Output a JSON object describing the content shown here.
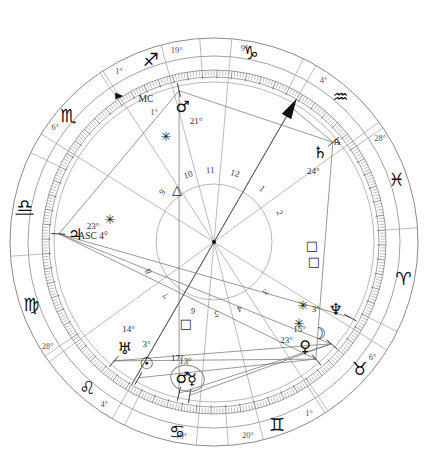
{
  "chart": {
    "type": "astrological-natal-wheel",
    "center": {
      "x": 214,
      "y": 242
    },
    "radii": {
      "outer_rim": 204,
      "sign_band_outer": 186,
      "degree_ring_outer": 172,
      "degree_ring_inner": 165,
      "house_circle": 160,
      "inner_circle": 58
    },
    "ascendant_offset_deg": 184
  },
  "signs": [
    {
      "name": "Aries",
      "glyph": "♈",
      "start_deg": 0
    },
    {
      "name": "Taurus",
      "glyph": "♉",
      "start_deg": 30
    },
    {
      "name": "Gemini",
      "glyph": "♊",
      "start_deg": 60
    },
    {
      "name": "Cancer",
      "glyph": "♋",
      "start_deg": 90
    },
    {
      "name": "Leo",
      "glyph": "♌",
      "start_deg": 120
    },
    {
      "name": "Virgo",
      "glyph": "♍",
      "start_deg": 150
    },
    {
      "name": "Libra",
      "glyph": "♎",
      "start_deg": 180,
      "underlined": true
    },
    {
      "name": "Scorpio",
      "glyph": "♏",
      "start_deg": 210
    },
    {
      "name": "Sagittarius",
      "glyph": "♐",
      "start_deg": 240
    },
    {
      "name": "Capricorn",
      "glyph": "♑",
      "start_deg": 270
    },
    {
      "name": "Aquarius",
      "glyph": "♒",
      "start_deg": 300
    },
    {
      "name": "Pisces",
      "glyph": "♓",
      "start_deg": 330
    }
  ],
  "house_cusps": [
    {
      "house": 1,
      "label": "4°",
      "abs_deg": 304,
      "sign": "Aquarius",
      "is_angle": true,
      "angle_name": "ASC"
    },
    {
      "house": 2,
      "label": "28°",
      "abs_deg": 328,
      "sign": "Pisces"
    },
    {
      "house": 3,
      "label": "6°",
      "abs_deg": 36,
      "sign": "Taurus"
    },
    {
      "house": 4,
      "label": "1°",
      "abs_deg": 61,
      "sign": "Gemini"
    },
    {
      "house": 5,
      "label": "20°",
      "abs_deg": 80,
      "sign": "Gemini"
    },
    {
      "house": 6,
      "label": "9°",
      "abs_deg": 99,
      "sign": "Cancer"
    },
    {
      "house": 7,
      "label": "4°",
      "abs_deg": 124,
      "sign": "Leo",
      "is_angle": true,
      "angle_name": "DSC"
    },
    {
      "house": 8,
      "label": "28°",
      "abs_deg": 148,
      "sign": "Leo"
    },
    {
      "house": 9,
      "label": "6°",
      "abs_deg": 216,
      "sign": "Scorpio"
    },
    {
      "house": 10,
      "label": "1°",
      "abs_deg": 241,
      "sign": "Sagittarius",
      "is_angle": true,
      "angle_name": "MC"
    },
    {
      "house": 11,
      "label": "19°",
      "abs_deg": 259,
      "sign": "Sagittarius"
    },
    {
      "house": 12,
      "label": "9°",
      "abs_deg": 279,
      "sign": "Capricorn"
    }
  ],
  "house_numbers": [
    {
      "n": "1",
      "abs_deg": 304
    },
    {
      "n": "2",
      "abs_deg": 328
    },
    {
      "n": "3",
      "abs_deg": 36
    },
    {
      "n": "4",
      "abs_deg": 61
    },
    {
      "n": "5",
      "abs_deg": 80
    },
    {
      "n": "6",
      "abs_deg": 99
    },
    {
      "n": "7",
      "abs_deg": 124
    },
    {
      "n": "8",
      "abs_deg": 148
    },
    {
      "n": "9",
      "abs_deg": 216
    },
    {
      "n": "10",
      "abs_deg": 241
    },
    {
      "n": "11",
      "abs_deg": 259
    },
    {
      "n": "12",
      "abs_deg": 279
    }
  ],
  "angles": [
    {
      "name": "ASC",
      "label": "ASC",
      "degree_label": "4°",
      "abs_deg": 304,
      "marker": "arrow"
    },
    {
      "name": "MC",
      "label": "MC",
      "degree_label": "1°",
      "abs_deg": 241,
      "marker": "triangle"
    }
  ],
  "planets": [
    {
      "name": "Jupiter",
      "glyph": "♃",
      "degree_label": "23°",
      "abs_deg": 187,
      "sign": "Libra",
      "retrograde": false
    },
    {
      "name": "Uranus",
      "glyph": "♅",
      "degree_label": "14°",
      "abs_deg": 134,
      "sign": "Leo",
      "retrograde": false
    },
    {
      "name": "Sun",
      "glyph": "☉",
      "degree_label": "3°",
      "abs_deg": 123,
      "sign": "Leo",
      "retrograde": false
    },
    {
      "name": "Mars",
      "glyph": "♂",
      "degree_label": "17°",
      "abs_deg": 107,
      "sign": "Cancer",
      "retrograde": false
    },
    {
      "name": "Mercury",
      "glyph": "☿",
      "degree_label": "13°",
      "abs_deg": 103,
      "sign": "Cancer",
      "retrograde": false
    },
    {
      "name": "Venus",
      "glyph": "♀",
      "degree_label": "23°",
      "abs_deg": 53,
      "sign": "Taurus",
      "retrograde": false
    },
    {
      "name": "Moon",
      "glyph": "☽",
      "degree_label": "15°",
      "abs_deg": 45,
      "sign": "Taurus",
      "retrograde": false
    },
    {
      "name": "Neptune",
      "glyph": "♆",
      "degree_label": "3°",
      "abs_deg": 33,
      "sign": "Taurus",
      "retrograde": false
    },
    {
      "name": "Saturn",
      "glyph": "♄",
      "degree_label": "24°",
      "abs_deg": 324,
      "sign": "Pisces",
      "retrograde": true,
      "retro_label": "℞"
    },
    {
      "name": "Pluto",
      "glyph": "♂",
      "degree_label": "21°",
      "abs_deg": 261,
      "sign": "Sagittarius",
      "retrograde": false
    }
  ],
  "planet_group": {
    "note": "Mars and Mercury enclosed by a grouping ellipse",
    "members": [
      "Mars",
      "Mercury"
    ]
  },
  "aspects": [
    {
      "type": "sextile",
      "glyph": "✳",
      "from": "Pluto",
      "to": "Jupiter",
      "x": 166,
      "y": 136
    },
    {
      "type": "trine",
      "glyph": "△",
      "from": "Pluto",
      "to": "Mars",
      "x": 177,
      "y": 189
    },
    {
      "type": "sextile",
      "glyph": "✳",
      "from": "Saturn",
      "to": "ASC",
      "x": 110,
      "y": 219
    },
    {
      "type": "square",
      "glyph": "□",
      "from": "Saturn",
      "to": "Venus",
      "x": 186,
      "y": 323
    },
    {
      "type": "square",
      "glyph": "□",
      "from": "Jupiter",
      "to": "Sun",
      "x": 312,
      "y": 245
    },
    {
      "type": "square",
      "glyph": "□",
      "from": "Jupiter",
      "to": "Uranus",
      "x": 314,
      "y": 261
    },
    {
      "type": "sextile",
      "glyph": "✳",
      "from": "Venus",
      "to": "Mars",
      "x": 303,
      "y": 305
    },
    {
      "type": "sextile",
      "glyph": "✳",
      "from": "Moon",
      "to": "Mercury",
      "x": 299,
      "y": 323
    }
  ],
  "aspect_lines": [
    {
      "from_deg": 187,
      "to_deg": 261
    },
    {
      "from_deg": 187,
      "to_deg": 53
    },
    {
      "from_deg": 187,
      "to_deg": 45
    },
    {
      "from_deg": 261,
      "to_deg": 107
    },
    {
      "from_deg": 261,
      "to_deg": 324
    },
    {
      "from_deg": 324,
      "to_deg": 53
    },
    {
      "from_deg": 324,
      "to_deg": 304
    },
    {
      "from_deg": 134,
      "to_deg": 53
    },
    {
      "from_deg": 123,
      "to_deg": 53
    },
    {
      "from_deg": 107,
      "to_deg": 45
    },
    {
      "from_deg": 103,
      "to_deg": 45
    },
    {
      "from_deg": 134,
      "to_deg": 45
    },
    {
      "from_deg": 33,
      "to_deg": 187
    },
    {
      "from_deg": 304,
      "to_deg": 124
    }
  ]
}
